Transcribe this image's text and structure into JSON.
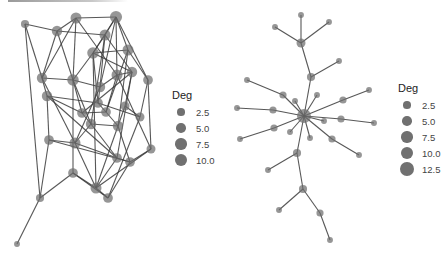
{
  "colors": {
    "node": "#6e6e6e",
    "edge": "#3a3a3a",
    "background": "#ffffff",
    "legend_text": "#444444"
  },
  "left_network": {
    "legend": {
      "title": "Deg",
      "entries": [
        {
          "label": "2.5",
          "size": 2.5
        },
        {
          "label": "5.0",
          "size": 5.0
        },
        {
          "label": "7.5",
          "size": 7.5
        },
        {
          "label": "10.0",
          "size": 10.0
        }
      ]
    },
    "nodes": [
      {
        "id": "A",
        "x": 25,
        "y": 24,
        "deg": 3
      },
      {
        "id": "B",
        "x": 57,
        "y": 31,
        "deg": 6
      },
      {
        "id": "C",
        "x": 76,
        "y": 18,
        "deg": 7
      },
      {
        "id": "D",
        "x": 116,
        "y": 17,
        "deg": 9
      },
      {
        "id": "E",
        "x": 105,
        "y": 35,
        "deg": 7
      },
      {
        "id": "F",
        "x": 128,
        "y": 50,
        "deg": 7
      },
      {
        "id": "G",
        "x": 93,
        "y": 53,
        "deg": 8
      },
      {
        "id": "H",
        "x": 132,
        "y": 72,
        "deg": 6
      },
      {
        "id": "I",
        "x": 117,
        "y": 75,
        "deg": 7
      },
      {
        "id": "J",
        "x": 148,
        "y": 80,
        "deg": 5
      },
      {
        "id": "K",
        "x": 42,
        "y": 78,
        "deg": 6
      },
      {
        "id": "L",
        "x": 73,
        "y": 80,
        "deg": 8
      },
      {
        "id": "M",
        "x": 47,
        "y": 96,
        "deg": 6
      },
      {
        "id": "N",
        "x": 100,
        "y": 87,
        "deg": 6
      },
      {
        "id": "O",
        "x": 98,
        "y": 103,
        "deg": 5
      },
      {
        "id": "P",
        "x": 106,
        "y": 112,
        "deg": 5
      },
      {
        "id": "Q",
        "x": 82,
        "y": 113,
        "deg": 5
      },
      {
        "id": "R",
        "x": 125,
        "y": 106,
        "deg": 4
      },
      {
        "id": "S",
        "x": 140,
        "y": 117,
        "deg": 4
      },
      {
        "id": "T",
        "x": 91,
        "y": 124,
        "deg": 6
      },
      {
        "id": "U",
        "x": 118,
        "y": 126,
        "deg": 6
      },
      {
        "id": "V",
        "x": 49,
        "y": 140,
        "deg": 5
      },
      {
        "id": "W",
        "x": 75,
        "y": 143,
        "deg": 7
      },
      {
        "id": "X",
        "x": 117,
        "y": 158,
        "deg": 5
      },
      {
        "id": "Y",
        "x": 130,
        "y": 162,
        "deg": 5
      },
      {
        "id": "Z",
        "x": 151,
        "y": 149,
        "deg": 4
      },
      {
        "id": "a",
        "x": 73,
        "y": 173,
        "deg": 5
      },
      {
        "id": "b",
        "x": 96,
        "y": 188,
        "deg": 7
      },
      {
        "id": "c",
        "x": 108,
        "y": 198,
        "deg": 5
      },
      {
        "id": "d",
        "x": 40,
        "y": 198,
        "deg": 3
      },
      {
        "id": "e",
        "x": 17,
        "y": 244,
        "deg": 1
      }
    ],
    "edges": [
      [
        "A",
        "B"
      ],
      [
        "A",
        "K"
      ],
      [
        "A",
        "d"
      ],
      [
        "B",
        "C"
      ],
      [
        "B",
        "E"
      ],
      [
        "B",
        "K"
      ],
      [
        "B",
        "L"
      ],
      [
        "C",
        "D"
      ],
      [
        "C",
        "L"
      ],
      [
        "C",
        "I"
      ],
      [
        "C",
        "K"
      ],
      [
        "D",
        "E"
      ],
      [
        "D",
        "F"
      ],
      [
        "D",
        "G"
      ],
      [
        "D",
        "I"
      ],
      [
        "D",
        "J"
      ],
      [
        "D",
        "N"
      ],
      [
        "E",
        "G"
      ],
      [
        "E",
        "H"
      ],
      [
        "E",
        "N"
      ],
      [
        "E",
        "T"
      ],
      [
        "F",
        "G"
      ],
      [
        "F",
        "J"
      ],
      [
        "F",
        "P"
      ],
      [
        "F",
        "U"
      ],
      [
        "G",
        "L"
      ],
      [
        "G",
        "O"
      ],
      [
        "G",
        "H"
      ],
      [
        "H",
        "I"
      ],
      [
        "H",
        "R"
      ],
      [
        "H",
        "Q"
      ],
      [
        "I",
        "N"
      ],
      [
        "I",
        "P"
      ],
      [
        "J",
        "S"
      ],
      [
        "J",
        "Z"
      ],
      [
        "K",
        "L"
      ],
      [
        "K",
        "M"
      ],
      [
        "K",
        "W"
      ],
      [
        "L",
        "N"
      ],
      [
        "L",
        "Q"
      ],
      [
        "L",
        "T"
      ],
      [
        "L",
        "a"
      ],
      [
        "M",
        "V"
      ],
      [
        "M",
        "O"
      ],
      [
        "M",
        "Q"
      ],
      [
        "N",
        "O"
      ],
      [
        "N",
        "W"
      ],
      [
        "O",
        "P"
      ],
      [
        "O",
        "S"
      ],
      [
        "P",
        "Q"
      ],
      [
        "P",
        "U"
      ],
      [
        "Q",
        "T"
      ],
      [
        "R",
        "S"
      ],
      [
        "R",
        "U"
      ],
      [
        "S",
        "c"
      ],
      [
        "T",
        "U"
      ],
      [
        "T",
        "X"
      ],
      [
        "T",
        "W"
      ],
      [
        "U",
        "Y"
      ],
      [
        "U",
        "b"
      ],
      [
        "V",
        "d"
      ],
      [
        "V",
        "W"
      ],
      [
        "V",
        "Y"
      ],
      [
        "W",
        "X"
      ],
      [
        "W",
        "b"
      ],
      [
        "X",
        "Y"
      ],
      [
        "X",
        "b"
      ],
      [
        "Y",
        "Z"
      ],
      [
        "Y",
        "c"
      ],
      [
        "Z",
        "b"
      ],
      [
        "a",
        "b"
      ],
      [
        "a",
        "c"
      ],
      [
        "a",
        "d"
      ],
      [
        "b",
        "c"
      ],
      [
        "d",
        "e"
      ],
      [
        "M",
        "X"
      ],
      [
        "H",
        "X"
      ],
      [
        "G",
        "b"
      ],
      [
        "I",
        "Z"
      ]
    ]
  },
  "right_network": {
    "legend": {
      "title": "Deg",
      "entries": [
        {
          "label": "2.5",
          "size": 2.5
        },
        {
          "label": "5.0",
          "size": 5.0
        },
        {
          "label": "7.5",
          "size": 7.5
        },
        {
          "label": "10.0",
          "size": 10.0
        },
        {
          "label": "12.5",
          "size": 12.5
        }
      ]
    },
    "nodes": [
      {
        "id": "hub",
        "x": 304,
        "y": 116,
        "deg": 13
      },
      {
        "id": "n1",
        "x": 301,
        "y": 43,
        "deg": 4
      },
      {
        "id": "n2",
        "x": 311,
        "y": 77,
        "deg": 3
      },
      {
        "id": "top",
        "x": 301,
        "y": 15,
        "deg": 1
      },
      {
        "id": "tl",
        "x": 275,
        "y": 27,
        "deg": 1
      },
      {
        "id": "tr",
        "x": 329,
        "y": 22,
        "deg": 1
      },
      {
        "id": "r1",
        "x": 339,
        "y": 61,
        "deg": 1
      },
      {
        "id": "l1",
        "x": 283,
        "y": 95,
        "deg": 2
      },
      {
        "id": "l2",
        "x": 247,
        "y": 80,
        "deg": 1
      },
      {
        "id": "l3",
        "x": 273,
        "y": 110,
        "deg": 2
      },
      {
        "id": "l4",
        "x": 237,
        "y": 108,
        "deg": 1
      },
      {
        "id": "l5",
        "x": 274,
        "y": 128,
        "deg": 2
      },
      {
        "id": "l6",
        "x": 240,
        "y": 139,
        "deg": 1
      },
      {
        "id": "ur1",
        "x": 343,
        "y": 100,
        "deg": 2
      },
      {
        "id": "ur2",
        "x": 369,
        "y": 90,
        "deg": 1
      },
      {
        "id": "r2",
        "x": 341,
        "y": 119,
        "deg": 2
      },
      {
        "id": "r3",
        "x": 374,
        "y": 123,
        "deg": 1
      },
      {
        "id": "sm1",
        "x": 295,
        "y": 101,
        "deg": 1
      },
      {
        "id": "sm2",
        "x": 317,
        "y": 95,
        "deg": 1
      },
      {
        "id": "sm3",
        "x": 324,
        "y": 121,
        "deg": 1
      },
      {
        "id": "sm4",
        "x": 290,
        "y": 132,
        "deg": 1
      },
      {
        "id": "sm5",
        "x": 310,
        "y": 138,
        "deg": 1
      },
      {
        "id": "dr1",
        "x": 332,
        "y": 139,
        "deg": 2
      },
      {
        "id": "dr2",
        "x": 359,
        "y": 155,
        "deg": 1
      },
      {
        "id": "d1",
        "x": 297,
        "y": 153,
        "deg": 3
      },
      {
        "id": "dl1",
        "x": 268,
        "y": 170,
        "deg": 1
      },
      {
        "id": "d2",
        "x": 303,
        "y": 189,
        "deg": 3
      },
      {
        "id": "d3",
        "x": 279,
        "y": 210,
        "deg": 1
      },
      {
        "id": "d4",
        "x": 320,
        "y": 213,
        "deg": 2
      },
      {
        "id": "d5",
        "x": 330,
        "y": 240,
        "deg": 1
      }
    ],
    "edges": [
      [
        "n1",
        "top"
      ],
      [
        "n1",
        "tl"
      ],
      [
        "n1",
        "tr"
      ],
      [
        "n1",
        "n2"
      ],
      [
        "n2",
        "r1"
      ],
      [
        "n2",
        "hub"
      ],
      [
        "hub",
        "l1"
      ],
      [
        "l1",
        "l2"
      ],
      [
        "hub",
        "l3"
      ],
      [
        "l3",
        "l4"
      ],
      [
        "hub",
        "l5"
      ],
      [
        "l5",
        "l6"
      ],
      [
        "hub",
        "ur1"
      ],
      [
        "ur1",
        "ur2"
      ],
      [
        "hub",
        "r2"
      ],
      [
        "r2",
        "r3"
      ],
      [
        "hub",
        "sm1"
      ],
      [
        "hub",
        "sm2"
      ],
      [
        "hub",
        "sm3"
      ],
      [
        "hub",
        "sm4"
      ],
      [
        "hub",
        "sm5"
      ],
      [
        "hub",
        "dr1"
      ],
      [
        "dr1",
        "dr2"
      ],
      [
        "hub",
        "d1"
      ],
      [
        "d1",
        "dl1"
      ],
      [
        "d1",
        "d2"
      ],
      [
        "d2",
        "d3"
      ],
      [
        "d2",
        "d4"
      ],
      [
        "d4",
        "d5"
      ]
    ]
  }
}
